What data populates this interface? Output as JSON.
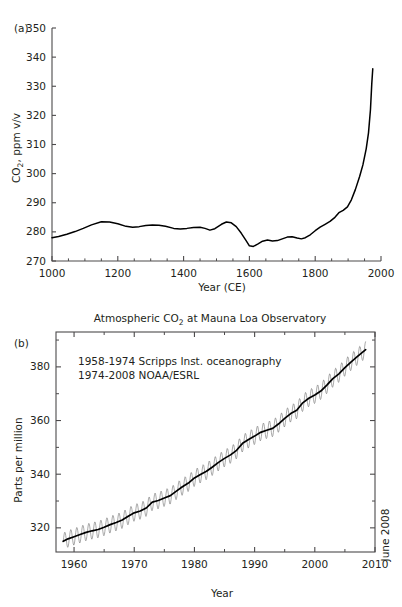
{
  "figure": {
    "panel_a_tag": "(a)",
    "panel_b_tag": "(b)"
  },
  "chart_data": [
    {
      "id": "panel-a",
      "type": "line",
      "title": "",
      "xlabel": "Year (CE)",
      "ylabel": "CO2, ppm v/v",
      "ylabel_main": "CO",
      "ylabel_sub": "2",
      "ylabel_rest": ", ppm v/v",
      "xlim": [
        1000,
        2000
      ],
      "ylim": [
        270,
        350
      ],
      "xticks": [
        1000,
        1200,
        1400,
        1600,
        1800,
        2000
      ],
      "xticklabels": [
        "1000",
        "1200",
        "1400",
        "1600",
        "1800",
        "2000"
      ],
      "yticks": [
        270,
        280,
        290,
        300,
        310,
        320,
        330,
        340,
        350
      ],
      "yticklabels": [
        "270",
        "280",
        "290",
        "300",
        "310",
        "320",
        "330",
        "340",
        "350"
      ],
      "xminor_step": 50,
      "grid": false,
      "legend": "none",
      "frame": "left-bottom",
      "series": [
        {
          "name": "Ice core CO2",
          "x": [
            1000,
            1020,
            1045,
            1070,
            1095,
            1120,
            1150,
            1175,
            1200,
            1225,
            1245,
            1265,
            1285,
            1305,
            1325,
            1345,
            1370,
            1390,
            1410,
            1430,
            1450,
            1465,
            1480,
            1495,
            1515,
            1530,
            1545,
            1560,
            1575,
            1590,
            1600,
            1612,
            1625,
            1640,
            1655,
            1670,
            1685,
            1700,
            1715,
            1730,
            1745,
            1758,
            1770,
            1785,
            1800,
            1815,
            1830,
            1845,
            1860,
            1872,
            1885,
            1898,
            1910,
            1922,
            1935,
            1945,
            1955,
            1962,
            1968,
            1972,
            1975
          ],
          "values": [
            278.0,
            278.4,
            279.2,
            280.1,
            281.2,
            282.4,
            283.5,
            283.4,
            282.8,
            281.9,
            281.6,
            281.8,
            282.2,
            282.4,
            282.3,
            281.9,
            281.2,
            281.0,
            281.2,
            281.5,
            281.6,
            281.2,
            280.6,
            281.1,
            282.6,
            283.4,
            283.1,
            281.8,
            279.6,
            277.0,
            275.2,
            275.0,
            275.8,
            276.8,
            277.2,
            276.9,
            277.0,
            277.6,
            278.2,
            278.3,
            277.9,
            277.6,
            278.0,
            279.0,
            280.4,
            281.6,
            282.6,
            283.6,
            285.0,
            286.6,
            287.4,
            288.6,
            291.0,
            294.5,
            299.0,
            303.0,
            308.5,
            314.0,
            322.0,
            331.0,
            336.0
          ]
        }
      ]
    },
    {
      "id": "panel-b",
      "type": "line",
      "title": "Atmospheric CO2 at Mauna Loa Observatory",
      "title_main": "Atmospheric CO",
      "title_sub": "2",
      "title_rest": " at Mauna Loa Observatory",
      "xlabel": "Year",
      "ylabel": "Parts per million",
      "xlim": [
        1957.0,
        2010.0
      ],
      "ylim": [
        311.0,
        393.0
      ],
      "xticks": [
        1960,
        1970,
        1980,
        1990,
        2000,
        2010
      ],
      "xticklabels": [
        "1960",
        "1970",
        "1980",
        "1990",
        "2000",
        "2010"
      ],
      "yticks": [
        320,
        340,
        360,
        380
      ],
      "yticklabels": [
        "320",
        "340",
        "360",
        "380"
      ],
      "xminor_step": 5,
      "yminor_step": 10,
      "grid": false,
      "legend": "none",
      "frame": "box",
      "annotations": [
        "1958-1974 Scripps Inst. oceanography",
        "1974-2008 NOAA/ESRL"
      ],
      "side_note": "June 2008",
      "seasonal_amplitude": 3.1,
      "series": [
        {
          "name": "Monthly mean CO2",
          "description": "monthly values with seasonal cycle, generated from trend plus sine wave",
          "style": "thin-gray"
        },
        {
          "name": "Seasonally adjusted trend",
          "style": "thick-black",
          "x": [
            1958.2,
            1959,
            1960,
            1961,
            1962,
            1963,
            1964,
            1965,
            1966,
            1967,
            1968,
            1969,
            1970,
            1971,
            1972,
            1973,
            1974,
            1975,
            1976,
            1977,
            1978,
            1979,
            1980,
            1981,
            1982,
            1983,
            1984,
            1985,
            1986,
            1987,
            1988,
            1989,
            1990,
            1991,
            1992,
            1993,
            1994,
            1995,
            1996,
            1997,
            1998,
            1999,
            2000,
            2001,
            2002,
            2003,
            2004,
            2005,
            2006,
            2007,
            2008.45
          ],
          "values": [
            315.0,
            315.9,
            316.7,
            317.5,
            318.3,
            318.9,
            319.4,
            320.2,
            321.2,
            322.0,
            322.9,
            324.3,
            325.6,
            326.3,
            327.4,
            329.6,
            330.2,
            331.1,
            332.0,
            333.7,
            335.3,
            336.7,
            338.6,
            339.9,
            341.1,
            342.7,
            344.4,
            345.9,
            347.2,
            348.9,
            351.5,
            352.9,
            354.2,
            355.6,
            356.4,
            357.1,
            358.8,
            360.8,
            362.6,
            363.8,
            366.6,
            368.3,
            369.5,
            371.0,
            373.2,
            375.6,
            377.4,
            379.7,
            381.8,
            383.7,
            386.4
          ]
        }
      ]
    }
  ]
}
